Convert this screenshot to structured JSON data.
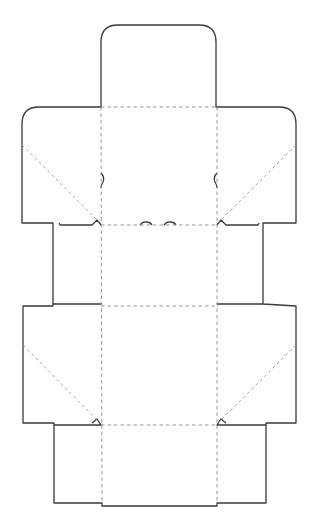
{
  "diagram": {
    "type": "box-dieline-template",
    "background": "#ffffff",
    "cut_line_color": "#3a3a3a",
    "fold_line_color": "#8a8a8a",
    "panels": [
      {
        "name": "top-tuck-flap",
        "shape": "rounded-tab"
      },
      {
        "name": "top-dust-flaps",
        "shape": "rounded-wing"
      },
      {
        "name": "side-panels-upper",
        "shape": "rectangle"
      },
      {
        "name": "front-panel",
        "shape": "rectangle"
      },
      {
        "name": "middle-dust-flaps",
        "shape": "rectangle-wing"
      },
      {
        "name": "bottom-panels",
        "shape": "rectangle"
      }
    ],
    "line_types": [
      "cut-line-solid",
      "fold-line-dashed",
      "diagonal-fold-dashed"
    ]
  }
}
